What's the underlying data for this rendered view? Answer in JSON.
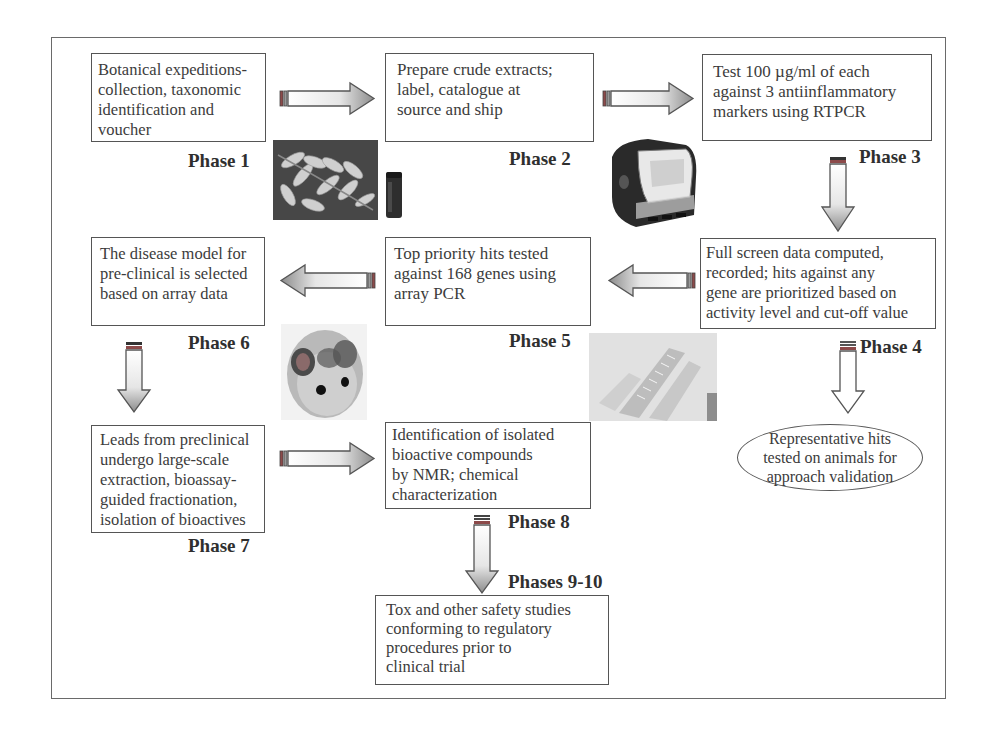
{
  "diagram": {
    "type": "flowchart",
    "phases": [
      {
        "id": "phase1",
        "label": "Phase 1",
        "text": "Botanical expeditions-collection, taxonomic identification and voucher",
        "image": "fern-leaf-and-vial-photo"
      },
      {
        "id": "phase2",
        "label": "Phase 2",
        "text": "Prepare crude extracts; label, catalogue at source and ship",
        "image": "rtpcr-instrument-photo"
      },
      {
        "id": "phase3",
        "label": "Phase 3",
        "text": "Test 100 µg/ml of each against 3 antiinflammatory markers using RTPCR"
      },
      {
        "id": "phase4",
        "label": "Phase 4",
        "text": "Full screen data computed, recorded; hits against any gene are prioritized based on activity level and cut-off value"
      },
      {
        "id": "phase5",
        "label": "Phase 5",
        "text": "Top priority hits tested against 168 genes using array PCR",
        "image": "pcr-plates-photo"
      },
      {
        "id": "phase6",
        "label": "Phase 6",
        "text": "The disease model for pre-clinical is selected based on array data",
        "image": "mouse-photo"
      },
      {
        "id": "phase7",
        "label": "Phase 7",
        "text": "Leads from preclinical undergo large-scale extraction, bioassay-guided fractionation, isolation of bioactives"
      },
      {
        "id": "phase8",
        "label": "Phase 8",
        "text": "Identification of isolated bioactive compounds by NMR; chemical characterization"
      },
      {
        "id": "phase9_10",
        "label": "Phases 9-10",
        "text": "Tox and other safety studies conforming to regulatory procedures prior to clinical trial"
      }
    ],
    "side_node": {
      "id": "validation",
      "text": "Representative hits tested on animals for approach validation",
      "shape": "ellipse"
    },
    "edges": [
      {
        "from": "phase1",
        "to": "phase2",
        "direction": "right"
      },
      {
        "from": "phase2",
        "to": "phase3",
        "direction": "right"
      },
      {
        "from": "phase3",
        "to": "phase4",
        "direction": "down"
      },
      {
        "from": "phase4",
        "to": "phase5",
        "direction": "left"
      },
      {
        "from": "phase4",
        "to": "validation",
        "direction": "down"
      },
      {
        "from": "phase5",
        "to": "phase6",
        "direction": "left"
      },
      {
        "from": "phase6",
        "to": "phase7",
        "direction": "down"
      },
      {
        "from": "phase7",
        "to": "phase8",
        "direction": "right"
      },
      {
        "from": "phase8",
        "to": "phase9_10",
        "direction": "down"
      }
    ]
  },
  "boxes": {
    "b1": {
      "lines": [
        "Botanical expeditions-",
        "collection, taxonomic",
        "identification and voucher"
      ]
    },
    "b2": {
      "lines": [
        "Prepare crude extracts;",
        "label, catalogue at",
        "source and ship"
      ]
    },
    "b3": {
      "lines": [
        "Test 100 µg/ml of each",
        "against 3 antiinflammatory",
        "markers using RTPCR"
      ]
    },
    "b4": {
      "lines": [
        "Full screen data computed,",
        "recorded; hits against any",
        "gene are prioritized based on",
        "activity level and cut-off value"
      ]
    },
    "b5": {
      "lines": [
        "Top priority hits tested",
        "against 168 genes using",
        "array PCR"
      ]
    },
    "b6": {
      "lines": [
        "The disease model for",
        "pre-clinical is selected",
        "based on array data"
      ]
    },
    "b7": {
      "lines": [
        "Leads from preclinical",
        "undergo large-scale",
        "extraction, bioassay-",
        "guided fractionation,",
        "isolation of bioactives"
      ]
    },
    "b8": {
      "lines": [
        "Identification of isolated",
        "bioactive compounds",
        "by NMR; chemical",
        "characterization"
      ]
    },
    "b9": {
      "lines": [
        "Tox and other safety studies",
        "conforming to regulatory",
        "procedures prior to",
        "clinical trial"
      ]
    },
    "ellipse": {
      "lines": [
        "Representative hits",
        "tested on animals for",
        "approach validation"
      ]
    }
  },
  "labels": {
    "p1": "Phase 1",
    "p2": "Phase 2",
    "p3": "Phase 3",
    "p4": "Phase 4",
    "p5": "Phase 5",
    "p6": "Phase 6",
    "p7": "Phase 7",
    "p8": "Phase 8",
    "p9": "Phases 9-10"
  },
  "colors": {
    "border": "#555555",
    "text": "#3c3c3c",
    "arrow_dark": "#8a8a8a",
    "arrow_light": "#f2f2f2",
    "cap_red": "#8c4a4a"
  }
}
